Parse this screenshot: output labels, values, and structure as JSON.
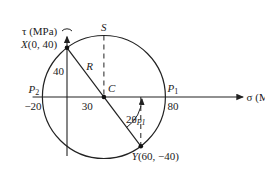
{
  "diagram": {
    "axes": {
      "sigma_label": "σ (MPa)",
      "tau_label": "τ (MPa)"
    },
    "units_scale_note": "stress in MPa",
    "center": {
      "sigma": 30,
      "tau": 0,
      "label": "C"
    },
    "radius": {
      "value": 50,
      "label": "R"
    },
    "points": {
      "X": {
        "label": "X(0, 40)",
        "sigma": 0,
        "tau": 40
      },
      "Y": {
        "label": "Y(60, −40)",
        "sigma": 60,
        "tau": -40
      },
      "P1": {
        "label": "P",
        "sub": "1",
        "sigma": 80,
        "value_label": "80"
      },
      "P2": {
        "label": "P",
        "sub": "2",
        "sigma": -20,
        "value_label": "−20"
      },
      "S": {
        "label": "S",
        "sigma": 30,
        "tau": 50
      }
    },
    "dimension_labels": {
      "tau_x": "40",
      "center_offset": "30"
    },
    "angle_label": {
      "main": "2θ",
      "sub": "P1"
    },
    "colors": {
      "ink": "#222222",
      "background": "#ffffff"
    }
  }
}
